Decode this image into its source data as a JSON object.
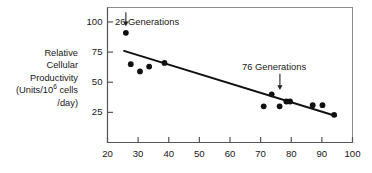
{
  "chart_data": {
    "type": "scatter",
    "title": "",
    "xlabel": "",
    "ylabel": "Relative Cellular Productivity (Units/10^6 cells /day)",
    "ylabel_lines": [
      "Relative",
      "Cellular",
      "Productivity",
      "(Units/10",
      "6",
      " cells",
      "/day)"
    ],
    "xlim": [
      20,
      100
    ],
    "ylim": [
      0,
      112
    ],
    "xticks": [
      20,
      30,
      40,
      50,
      60,
      70,
      80,
      90,
      100
    ],
    "xtick_labels": [
      "20",
      "30",
      "40",
      "50",
      "60",
      "70",
      "80",
      "90",
      "100"
    ],
    "yticks": [
      25,
      50,
      75,
      100
    ],
    "ytick_labels": [
      "25",
      "50",
      "75",
      "100"
    ],
    "grid": false,
    "legend": null,
    "marker": "filled-circle",
    "marker_color": "#111111",
    "points": [
      {
        "x": 26.0,
        "y": 91
      },
      {
        "x": 27.6,
        "y": 65
      },
      {
        "x": 30.6,
        "y": 59
      },
      {
        "x": 33.6,
        "y": 63
      },
      {
        "x": 38.6,
        "y": 66
      },
      {
        "x": 71.0,
        "y": 30
      },
      {
        "x": 73.6,
        "y": 40
      },
      {
        "x": 76.2,
        "y": 30
      },
      {
        "x": 78.4,
        "y": 34
      },
      {
        "x": 79.6,
        "y": 34
      },
      {
        "x": 87.0,
        "y": 31
      },
      {
        "x": 90.2,
        "y": 31
      },
      {
        "x": 94.0,
        "y": 23
      }
    ],
    "trendline": {
      "name": "regression-line",
      "x0": 25.4,
      "y0": 76,
      "x1": 94.6,
      "y1": 22,
      "color": "#111111"
    },
    "annotations": [
      {
        "id": "annot-26-generations",
        "label": "26 Generations",
        "text_x_px": 115,
        "text_y_px": 17,
        "arrow_x": 26.0,
        "arrow_y_top": 108,
        "arrow_y_tip": 97
      },
      {
        "id": "annot-76-generations",
        "label": "76 Generations",
        "text_x_px": 242,
        "text_y_px": 62,
        "arrow_x": 76.3,
        "arrow_y_top": 57,
        "arrow_y_tip": 44
      }
    ]
  },
  "axis": {
    "frame_color": "#8d8d8d",
    "axis_color": "#555555"
  }
}
